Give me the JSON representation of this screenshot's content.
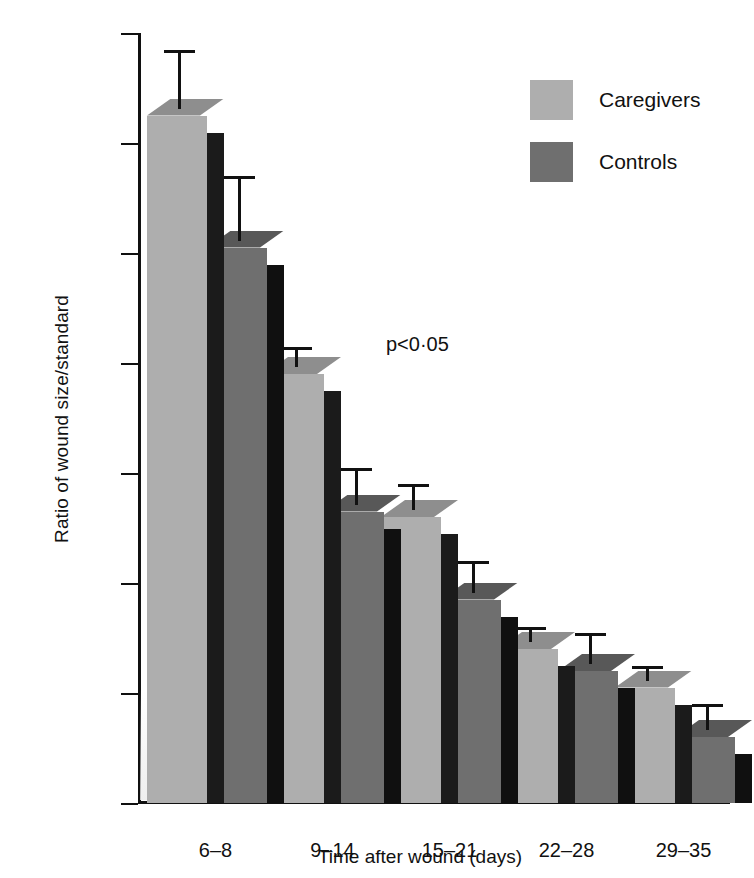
{
  "chart_data": {
    "type": "bar",
    "title": "",
    "xlabel": "Time after wound (days)",
    "ylabel": "Ratio of wound size/standard",
    "categories": [
      "6–8",
      "9–14",
      "15–21",
      "22–28",
      "29–35"
    ],
    "ytick_labels": [
      "1·50",
      "1·30",
      "1·10",
      "0·90",
      "0·70",
      "0·50",
      "0·30",
      "0·10"
    ],
    "ytick_values": [
      1.5,
      1.3,
      1.1,
      0.9,
      0.7,
      0.5,
      0.3,
      0.1
    ],
    "ylim": [
      0.1,
      1.5
    ],
    "grid": false,
    "legend_position": "top-right",
    "series": [
      {
        "name": "Caregivers",
        "color": "#aeaeae",
        "values": [
          1.35,
          0.88,
          0.62,
          0.38,
          0.31
        ],
        "err_upper": [
          1.47,
          0.93,
          0.68,
          0.42,
          0.35
        ],
        "err_lower": [
          1.35,
          0.88,
          0.62,
          0.38,
          0.31
        ]
      },
      {
        "name": "Controls",
        "color": "#6f6f6f",
        "values": [
          1.11,
          0.63,
          0.47,
          0.34,
          0.22
        ],
        "err_upper": [
          1.24,
          0.71,
          0.54,
          0.41,
          0.28
        ],
        "err_lower": [
          1.11,
          0.63,
          0.47,
          0.34,
          0.22
        ]
      }
    ],
    "annotations": [
      {
        "text": "p<0·05",
        "category": "9–14",
        "x": 248,
        "y": 300
      }
    ]
  },
  "legend": {
    "entries": [
      {
        "label": "Caregivers",
        "swatch": "light"
      },
      {
        "label": "Controls",
        "swatch": "dark"
      }
    ]
  },
  "colors": {
    "caregivers": "#aeaeae",
    "controls": "#6f6f6f",
    "axis": "#101010",
    "background": "#ffffff"
  }
}
